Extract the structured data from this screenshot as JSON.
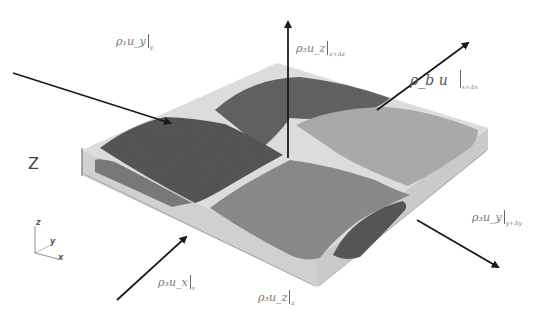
{
  "figure": {
    "type": "3D schematic of a porous slab layer with flux arrows",
    "axis_label_large": "Z",
    "triad": {
      "z": "z",
      "y": "y",
      "x": "x"
    },
    "colors": {
      "slab_light": "#d8d8d8",
      "slab_edge": "#bdbdbd",
      "blob_dark": "#5a5a5a",
      "blob_medium": "#7c7c7c",
      "blob_light": "#a9a9a9",
      "arrow": "#1a1a1a"
    }
  },
  "labels": {
    "inflow_y_left": {
      "text": "ρ₁u_y",
      "sub": "y"
    },
    "outflow_z_top": {
      "text": "ρ₃u_z",
      "sub": "z+Δz"
    },
    "outflow_x_right": {
      "text": "ρ_b u",
      "sub": "x+Δx"
    },
    "outflow_y_right": {
      "text": "ρ₃u_y",
      "sub": "y+Δy"
    },
    "inflow_x_bottom": {
      "text": "ρ₃u_x",
      "sub": "x"
    },
    "inflow_z_bottom": {
      "text": "ρ₃u_z",
      "sub": "z"
    }
  },
  "arrows": [
    {
      "name": "inflow-y-arrow",
      "from": [
        13,
        73
      ],
      "to": [
        172,
        124
      ]
    },
    {
      "name": "outflow-z-arrow",
      "from": [
        288,
        158
      ],
      "to": [
        288,
        22
      ]
    },
    {
      "name": "outflow-x-arrow",
      "from": [
        377,
        110
      ],
      "to": [
        470,
        42
      ]
    },
    {
      "name": "outflow-y-arrow",
      "from": [
        417,
        220
      ],
      "to": [
        500,
        268
      ]
    },
    {
      "name": "inflow-x-arrow",
      "from": [
        117,
        300
      ],
      "to": [
        188,
        236
      ]
    }
  ]
}
